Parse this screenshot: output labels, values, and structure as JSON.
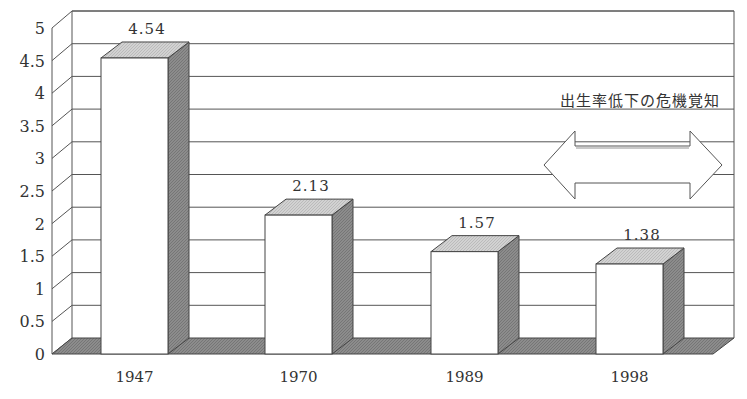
{
  "chart_data": {
    "type": "bar",
    "style": "3d",
    "title": "",
    "xlabel": "",
    "ylabel": "",
    "categories": [
      "1947",
      "1970",
      "1989",
      "1998"
    ],
    "values": [
      4.54,
      2.13,
      1.57,
      1.38
    ],
    "data_labels": [
      "4.54",
      "2.13",
      "1.57",
      "1.38"
    ],
    "ylim": [
      0,
      5
    ],
    "yticks": [
      "0",
      "0.5",
      "1",
      "1.5",
      "2",
      "2.5",
      "3",
      "3.5",
      "4",
      "4.5",
      "5"
    ],
    "grid": true,
    "legend": null,
    "annotations": [
      {
        "type": "text",
        "text": "出生率低下の危機覚知"
      },
      {
        "type": "double-arrow",
        "direction": "horizontal"
      }
    ],
    "colors": {
      "bar_front": "#ffffff",
      "bar_top": "#cfcfcf",
      "bar_side": "#8a8a8a",
      "floor": "#8a8a8a",
      "grid": "#555555",
      "text": "#333333"
    }
  }
}
